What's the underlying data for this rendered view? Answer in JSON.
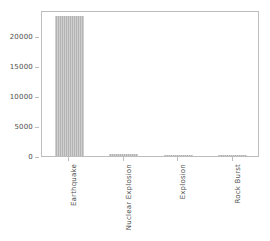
{
  "chart_data": {
    "type": "bar",
    "title": "",
    "xlabel": "",
    "ylabel": "",
    "categories": [
      "Earthquake",
      "Nuclear Explosion",
      "Explosion",
      "Rock Burst"
    ],
    "values": [
      23400,
      300,
      20,
      15
    ],
    "ylim": [
      0,
      24333
    ],
    "yticks": [
      0,
      5000,
      10000,
      15000,
      20000
    ],
    "ytick_labels": [
      "0",
      "5000",
      "10000",
      "15000",
      "20000"
    ],
    "grid": false,
    "legend": null,
    "bar_color": "#b3b3b3",
    "frame_color": "#bdbdbd",
    "tick_label_color": "#4d4d4d",
    "background": "#ffffff",
    "xtick_rotation": 90
  }
}
